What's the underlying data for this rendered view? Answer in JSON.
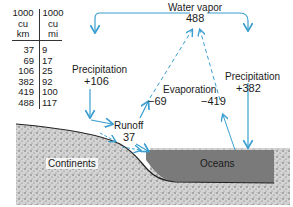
{
  "table": {
    "headers": [
      {
        "unit_line1": "1000",
        "unit_line2": "cu",
        "unit_line3": "km"
      },
      {
        "unit_line1": "1000",
        "unit_line2": "cu",
        "unit_line3": "mi"
      }
    ],
    "rows": [
      {
        "km": "37",
        "mi": "9"
      },
      {
        "km": "69",
        "mi": "17"
      },
      {
        "km": "106",
        "mi": "25"
      },
      {
        "km": "382",
        "mi": "92"
      },
      {
        "km": "419",
        "mi": "100"
      },
      {
        "km": "488",
        "mi": "117"
      }
    ]
  },
  "labels": {
    "water_vapor": "Water vapor",
    "water_vapor_value": "488",
    "precip_land": "Precipitation",
    "precip_land_value": "+106",
    "precip_ocean": "Precipitation",
    "precip_ocean_value": "+382",
    "evaporation": "Evaporation",
    "evap_land_value": "−69",
    "evap_ocean_value": "−419",
    "runoff": "Runoff",
    "runoff_value": "37",
    "continents": "Continents",
    "oceans": "Oceans"
  },
  "colors": {
    "arrow": "#3a9fd0",
    "ocean": "#7a7a7a",
    "land": "#c8c8c8"
  }
}
